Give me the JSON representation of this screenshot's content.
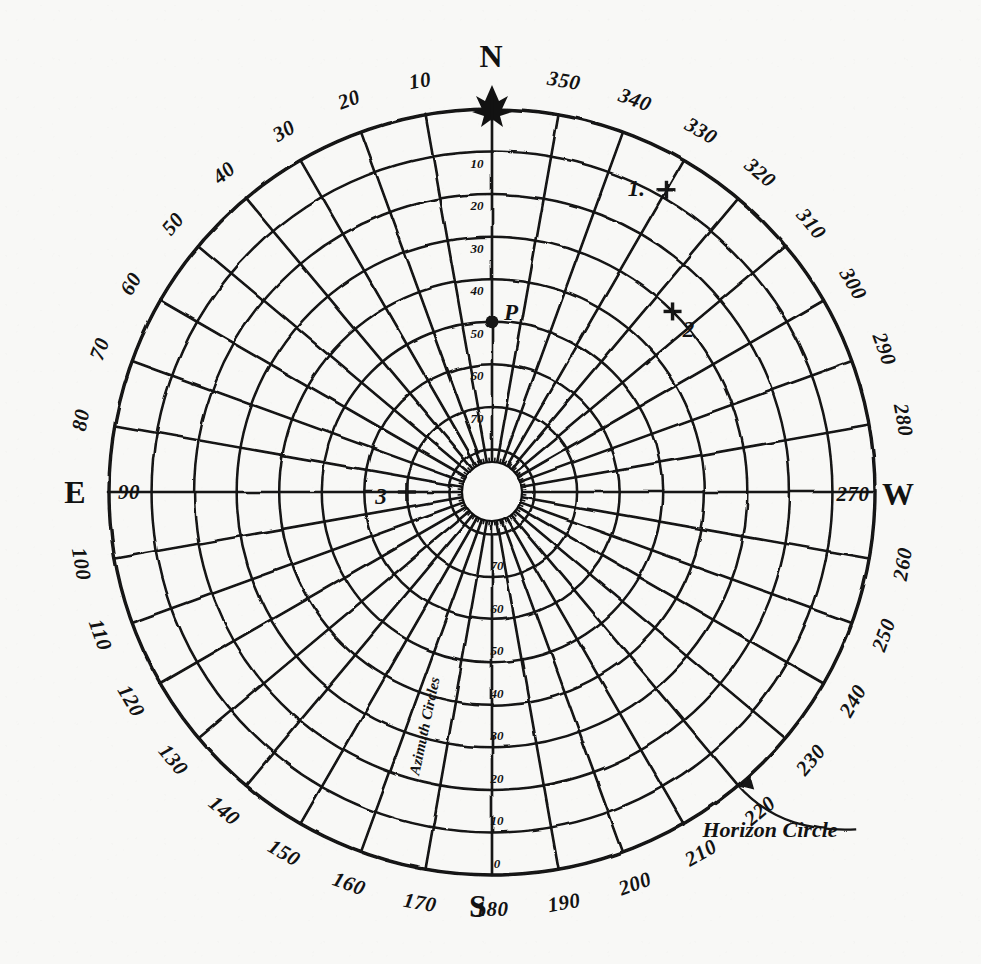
{
  "figure": {
    "kind": "hand-drawn-polar-azimuth-altitude-chart",
    "background_color": "#f8f8f6",
    "ink_color": "#121212"
  },
  "cardinals": [
    {
      "name": "north",
      "label": "N",
      "azimuth": 0
    },
    {
      "name": "east",
      "label": "E",
      "azimuth": 90
    },
    {
      "name": "south",
      "label": "S",
      "azimuth": 180
    },
    {
      "name": "west",
      "label": "W",
      "azimuth": 270
    }
  ],
  "annotations": {
    "horizon_circle": "Horizon Circle",
    "azimuth_circles": "Azimuth Circles"
  },
  "chart_data": {
    "type": "scatter",
    "title": "",
    "projection": "polar-azimuthal",
    "angular_axis": {
      "name": "Azimuth",
      "unit": "degrees",
      "origin": "N",
      "direction": "counterclockwise-as-drawn",
      "range": [
        0,
        360
      ],
      "step": 10,
      "tick_labels": [
        "10",
        "20",
        "30",
        "40",
        "50",
        "60",
        "70",
        "80",
        "90",
        "100",
        "110",
        "120",
        "130",
        "140",
        "150",
        "160",
        "170",
        "180",
        "190",
        "200",
        "210",
        "220",
        "230",
        "240",
        "250",
        "260",
        "270",
        "280",
        "290",
        "300",
        "310",
        "320",
        "330",
        "340",
        "350"
      ]
    },
    "radial_axis": {
      "name": "Altitude",
      "unit": "degrees",
      "range": [
        0,
        90
      ],
      "step": 10,
      "zero_at": "horizon-outer-circle",
      "ninety_at": "zenith-center",
      "tick_labels_upper": [
        "10",
        "20",
        "30",
        "40",
        "50",
        "60",
        "70"
      ],
      "tick_labels_lower": [
        "70",
        "60",
        "50",
        "40",
        "30",
        "20",
        "10",
        "0"
      ],
      "rings": [
        10,
        20,
        30,
        40,
        50,
        60,
        70,
        80
      ],
      "horizon_ring": 0
    },
    "grid": true,
    "legend": "none",
    "points": [
      {
        "label": "1",
        "azimuth": 330,
        "altitude": 8,
        "marker": "cross"
      },
      {
        "label": "2",
        "azimuth": 315,
        "altitude": 30,
        "marker": "cross"
      },
      {
        "label": "3",
        "azimuth": 90,
        "altitude": 70,
        "marker": "cross"
      },
      {
        "label": "P",
        "azimuth": 0,
        "altitude": 50,
        "marker": "dot"
      }
    ]
  }
}
